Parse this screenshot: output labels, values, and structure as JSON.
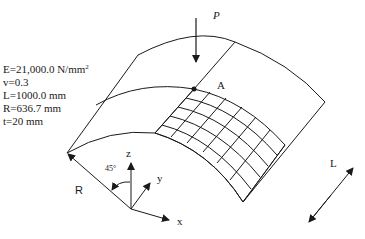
{
  "figure": {
    "type": "cylindrical shell roof under point load",
    "parameters": [
      {
        "text": "E=21,000.0 N/mm",
        "sup": "2"
      },
      {
        "text": "v=0.3",
        "sup": ""
      },
      {
        "text": "L=1000.0 mm",
        "sup": ""
      },
      {
        "text": "R=636.7 mm",
        "sup": ""
      },
      {
        "text": "t=20 mm",
        "sup": ""
      }
    ],
    "labels": {
      "load": "P",
      "point": "A",
      "radius": "R",
      "length": "L",
      "angle": "45°",
      "axis_x": "x",
      "axis_y": "y",
      "axis_z": "z"
    },
    "mesh": {
      "rows": 5,
      "cols": 6
    },
    "colors": {
      "stroke": "#1a1a1a",
      "background": "#ffffff"
    }
  }
}
